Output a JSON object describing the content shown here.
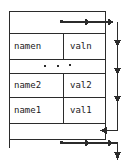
{
  "diagram": {
    "stroke_color": "#2b2b2b",
    "background_color": "#ffffff",
    "text_color": "#1a1a1a",
    "rows": [
      {
        "id": "row-n",
        "name": "namen",
        "value": "valn"
      },
      {
        "id": "row-2",
        "name": "name2",
        "value": "val2"
      },
      {
        "id": "row-1",
        "name": "name1",
        "value": "val1"
      }
    ],
    "ellipsis": {
      "id": "ellipsis-row",
      "dots": 3,
      "label": "..."
    },
    "pointers": [
      {
        "id": "top-pointer",
        "origin_label": "•",
        "direction": "right",
        "arrowhead": "▶"
      },
      {
        "id": "bottom-pointer",
        "origin_label": "•",
        "direction": "right",
        "arrowhead": "▶"
      }
    ],
    "link_arrows": [
      {
        "id": "arrow-down-1",
        "direction": "down"
      },
      {
        "id": "arrow-down-2",
        "direction": "down"
      },
      {
        "id": "arrow-down-3",
        "direction": "down"
      },
      {
        "id": "arrow-left-elbow",
        "direction": "left"
      },
      {
        "id": "arrow-down-tail",
        "direction": "down"
      }
    ]
  }
}
